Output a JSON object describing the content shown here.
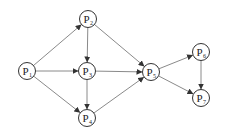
{
  "diagram": {
    "type": "directed-graph",
    "node_radius": 8.5,
    "colors": {
      "edge": "#8a8a8a",
      "arrow": "#333333",
      "node_stroke": "#333333",
      "text": "#222222"
    },
    "nodes": [
      {
        "id": "P1",
        "letter": "P",
        "sub": "1",
        "x": 27,
        "y": 71
      },
      {
        "id": "P2",
        "letter": "P",
        "sub": "2",
        "x": 88,
        "y": 19
      },
      {
        "id": "P3",
        "letter": "P",
        "sub": "3",
        "x": 87,
        "y": 71
      },
      {
        "id": "P4",
        "letter": "P",
        "sub": "4",
        "x": 87,
        "y": 118
      },
      {
        "id": "P5",
        "letter": "P",
        "sub": "5",
        "x": 151,
        "y": 72
      },
      {
        "id": "P6",
        "letter": "P",
        "sub": "6",
        "x": 201,
        "y": 52
      },
      {
        "id": "P7",
        "letter": "P",
        "sub": "7",
        "x": 201,
        "y": 98
      }
    ],
    "edges": [
      {
        "from": "P1",
        "to": "P2"
      },
      {
        "from": "P1",
        "to": "P3"
      },
      {
        "from": "P1",
        "to": "P4"
      },
      {
        "from": "P2",
        "to": "P3"
      },
      {
        "from": "P2",
        "to": "P5"
      },
      {
        "from": "P3",
        "to": "P4"
      },
      {
        "from": "P3",
        "to": "P5"
      },
      {
        "from": "P4",
        "to": "P5"
      },
      {
        "from": "P5",
        "to": "P6"
      },
      {
        "from": "P5",
        "to": "P7"
      },
      {
        "from": "P6",
        "to": "P7"
      }
    ]
  }
}
